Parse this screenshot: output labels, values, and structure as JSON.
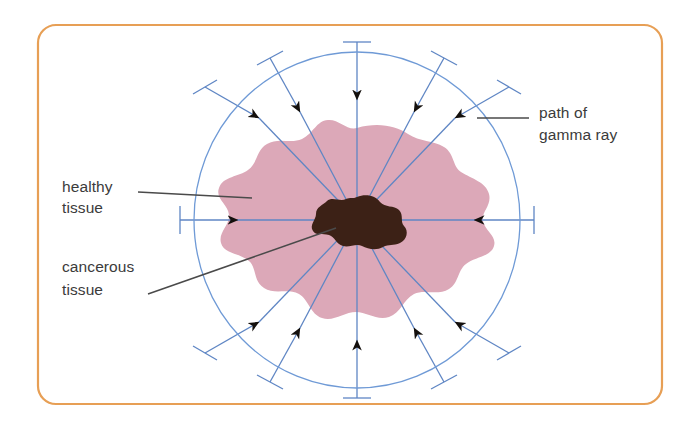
{
  "figure": {
    "kind": "radiotherapy-gamma-ray-diagram",
    "frame": {
      "border_color": "#e79f55",
      "border_width": 2.2,
      "corner_radius": 18,
      "x": 38,
      "y": 25,
      "width": 624,
      "height": 379
    },
    "canvas": {
      "width": 692,
      "height": 429,
      "background": "#ffffff"
    }
  },
  "colors": {
    "frame_orange": "#e79f55",
    "ray_blue": "#5f86c4",
    "circle_blue": "#6f9ad6",
    "healthy_pink": "#dca8b8",
    "tumour_brown": "#3c2116",
    "label_grey": "#3b3b3b",
    "leader_grey": "#4a4a4a",
    "arrowhead_black": "#14100d",
    "background": "#ffffff"
  },
  "body_outline": {
    "name": "patient-body-circle",
    "center_x": 357,
    "center_y": 220,
    "radius_x": 163,
    "radius_y": 168,
    "stroke": "#6f9ad6",
    "stroke_width": 1.3
  },
  "healthy_tissue": {
    "name": "healthy-tissue-region",
    "fill": "#dca8b8",
    "description": "irregular lobed blob of healthy tissue surrounding tumour"
  },
  "cancerous_tissue": {
    "name": "cancerous-tissue-region",
    "fill": "#3c2116",
    "center_x": 357,
    "center_y": 222,
    "description": "small dark irregular tumour mass at centre"
  },
  "gamma_rays": {
    "count": 12,
    "description": "twelve gamma ray beams converging on the tumour from all directions",
    "stroke": "#5f86c4",
    "stroke_width": 1.3,
    "arrow_direction": "inward toward centre",
    "angles_deg": [
      0,
      30,
      60,
      90,
      120,
      150,
      180,
      210,
      240,
      270,
      300,
      330
    ]
  },
  "labels": [
    {
      "id": "healthy-tissue",
      "lines": [
        "healthy",
        "tissue"
      ],
      "text_x": 62,
      "text_y": 186,
      "leader": {
        "x1": 138,
        "y1": 192,
        "x2": 252,
        "y2": 198
      }
    },
    {
      "id": "cancerous-tissue",
      "lines": [
        "cancerous",
        "tissue"
      ],
      "text_x": 62,
      "text_y": 272,
      "leader": {
        "x1": 148,
        "y1": 294,
        "x2": 336,
        "y2": 228
      }
    },
    {
      "id": "path-of-gamma-ray",
      "lines": [
        "path of",
        "gamma ray"
      ],
      "text_x": 539,
      "text_y": 113,
      "leader": {
        "x1": 477,
        "y1": 118,
        "x2": 529,
        "y2": 118
      }
    }
  ]
}
